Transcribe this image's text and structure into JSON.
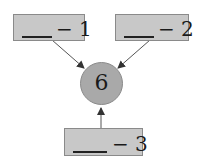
{
  "diagram": {
    "center": {
      "value": "6",
      "fill": "#a9a9a9"
    },
    "boxes": [
      {
        "id": "box-1",
        "label": "− 1",
        "blank": "____"
      },
      {
        "id": "box-2",
        "label": "− 2",
        "blank": "____"
      },
      {
        "id": "box-3",
        "label": "− 3",
        "blank": "____"
      }
    ],
    "box_fill": "#c8c8c8",
    "arrows": [
      {
        "from": "box-1",
        "to": "center"
      },
      {
        "from": "box-2",
        "to": "center"
      },
      {
        "from": "box-3",
        "to": "center"
      }
    ]
  }
}
